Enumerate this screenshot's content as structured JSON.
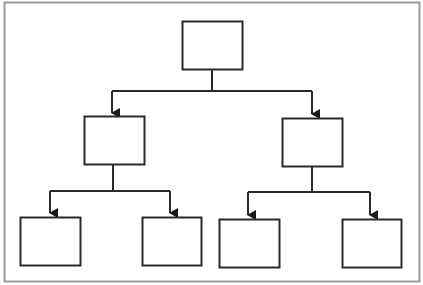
{
  "diagram": {
    "type": "tree",
    "frame": {
      "x": 4,
      "y": 2,
      "w": 415,
      "h": 279,
      "stroke": "#999999"
    },
    "line_color": "#2a2a2a",
    "nodes": [
      {
        "id": "root",
        "x": 182,
        "y": 21,
        "w": 60,
        "h": 48,
        "label": ""
      },
      {
        "id": "mid-left",
        "x": 84,
        "y": 116,
        "w": 60,
        "h": 48,
        "label": ""
      },
      {
        "id": "mid-right",
        "x": 282,
        "y": 118,
        "w": 60,
        "h": 48,
        "label": ""
      },
      {
        "id": "leaf-1",
        "x": 20,
        "y": 217,
        "w": 60,
        "h": 48,
        "label": ""
      },
      {
        "id": "leaf-2",
        "x": 142,
        "y": 217,
        "w": 59,
        "h": 48,
        "label": ""
      },
      {
        "id": "leaf-3",
        "x": 219,
        "y": 219,
        "w": 60,
        "h": 48,
        "label": ""
      },
      {
        "id": "leaf-4",
        "x": 342,
        "y": 219,
        "w": 59,
        "h": 48,
        "label": ""
      }
    ],
    "connectors": [
      {
        "id": "root-to-mid",
        "stem": [
          212,
          69,
          212,
          91
        ],
        "bar": [
          112,
          91,
          312,
          91
        ],
        "drops": [
          [
            112,
            91,
            112,
            113
          ],
          [
            312,
            91,
            312,
            114
          ]
        ]
      },
      {
        "id": "midleft-to-leaves",
        "stem": [
          113,
          164,
          113,
          191
        ],
        "bar": [
          50,
          191,
          170,
          191
        ],
        "drops": [
          [
            50,
            191,
            50,
            213
          ],
          [
            170,
            191,
            170,
            213
          ]
        ]
      },
      {
        "id": "midright-to-leaves",
        "stem": [
          312,
          166,
          312,
          192
        ],
        "bar": [
          248,
          192,
          370,
          192
        ],
        "drops": [
          [
            248,
            192,
            248,
            215
          ],
          [
            370,
            192,
            370,
            215
          ]
        ]
      }
    ]
  }
}
